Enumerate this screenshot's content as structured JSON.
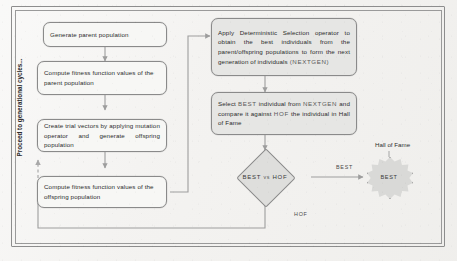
{
  "diagram": {
    "title_note": "Proceed to generational cycles...",
    "left_column": [
      {
        "id": "generate-parent-population",
        "text": "Generate parent population"
      },
      {
        "id": "compute-parent-fitness",
        "text": "Compute fitness function values of the parent  population"
      },
      {
        "id": "create-trial-vectors",
        "text": "Create trial vectors by applying mutation operator and generate offspring population"
      },
      {
        "id": "compute-offspring-fitness",
        "text": "Compute fitness function values of the offspring population"
      }
    ],
    "right_column": [
      {
        "id": "apply-deterministic-selection",
        "text": "Apply Deterministic Selection operator to obtain the best individuals from the parent/offspring populations to form the next generation of individuals ",
        "tail_smallcaps": "(NEXTGEN)"
      },
      {
        "id": "select-best-individual",
        "part1": "Select ",
        "sc1": "BEST",
        "part2": " individual from ",
        "sc2": "NEXTGEN",
        "part3": " and compare it against ",
        "sc3": "HOF",
        "part4": " the individual in Hall of Fame"
      }
    ],
    "decision": {
      "id": "best-vs-hof",
      "label": "BEST vs HOF"
    },
    "hall_of_fame": {
      "annotation": "Hall of Fame",
      "node_label": "BEST"
    },
    "edge_labels": {
      "best_branch": "BEST",
      "hof_branch": "HOF"
    },
    "colors": {
      "box_fill": "#f7f7f5",
      "grey_fill": "#e6e6e4",
      "diamond_fill": "#dededc",
      "star_fill": "#d9d9d7",
      "stroke": "#8a8a8a",
      "wire": "#9d9d9d",
      "page": "#f3f2f0"
    }
  }
}
